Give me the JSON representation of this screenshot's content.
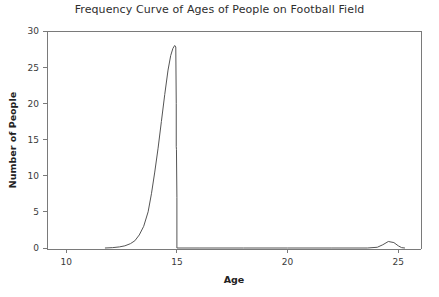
{
  "chart_data": {
    "type": "line",
    "title": "Frequency Curve of Ages of People on Football Field",
    "xlabel": "Age",
    "ylabel": "Number of People",
    "xlim": [
      8.6,
      26.8
    ],
    "ylim": [
      -1.2,
      30.6
    ],
    "xticks": [
      10,
      15,
      20,
      25
    ],
    "xticklabels": [
      "10",
      "15",
      "20",
      "25"
    ],
    "yticks": [
      0,
      5,
      10,
      15,
      20,
      25,
      30
    ],
    "yticklabels": [
      "0",
      "5",
      "10",
      "15",
      "20",
      "25",
      "30"
    ],
    "grid": false,
    "legend": false,
    "legend_position": "none",
    "series": [
      {
        "name": "Frequency of ages",
        "color": "#555555",
        "x": [
          11.75,
          12.1,
          12.4,
          12.65,
          12.9,
          13.1,
          13.3,
          13.5,
          13.7,
          13.85,
          14.0,
          14.15,
          14.3,
          14.45,
          14.6,
          14.72,
          14.82,
          14.9,
          14.95,
          14.97,
          14.97,
          14.98,
          15.0,
          15.0,
          16.0,
          18.0,
          20.0,
          22.0,
          23.6,
          24.05,
          24.3,
          24.55,
          24.8,
          25.0,
          25.15,
          25.3
        ],
        "y": [
          0.0,
          0.05,
          0.15,
          0.3,
          0.6,
          1.0,
          1.8,
          3.0,
          5.0,
          7.5,
          10.5,
          13.8,
          17.5,
          21.2,
          24.6,
          26.6,
          27.6,
          28.0,
          27.8,
          20.0,
          14.0,
          13.6,
          7.0,
          0.0,
          0.0,
          0.0,
          0.0,
          0.0,
          0.0,
          0.1,
          0.45,
          0.9,
          0.75,
          0.3,
          0.05,
          0.0
        ]
      }
    ],
    "annotations": {
      "peak_age": 14.9,
      "peak_value": 28,
      "secondary_bump_age": 24.55,
      "secondary_bump_value": 0.9,
      "curve_start_age": 11.75,
      "curve_end_age": 25.3
    }
  }
}
